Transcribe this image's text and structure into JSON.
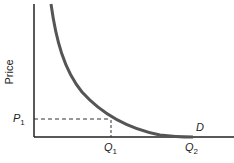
{
  "diagram": {
    "y_axis_label": "Price",
    "curve_label": "D",
    "price_marker": {
      "symbol": "P",
      "subscript": "1"
    },
    "quantity_markers": [
      {
        "symbol": "Q",
        "subscript": "1"
      },
      {
        "symbol": "Q",
        "subscript": "2"
      }
    ],
    "colors": {
      "axis": "#222222",
      "curve": "#555555",
      "dashed": "#333333"
    }
  }
}
